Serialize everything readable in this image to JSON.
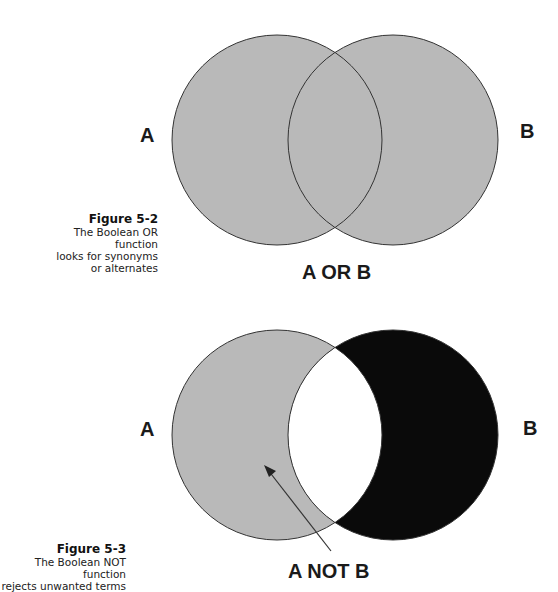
{
  "figures": [
    {
      "id_label": "Figure 5-2",
      "caption_lines": [
        "The Boolean OR function",
        "looks for synonyms",
        "or alternates"
      ],
      "set_a_label": "A",
      "set_b_label": "B",
      "operation_label": "A OR B",
      "shading": {
        "a_only": "#b9b9b9",
        "intersection": "#b9b9b9",
        "b_only": "#b9b9b9"
      }
    },
    {
      "id_label": "Figure 5-3",
      "caption_lines": [
        "The Boolean NOT function",
        "rejects unwanted terms"
      ],
      "set_a_label": "A",
      "set_b_label": "B",
      "operation_label": "A NOT B",
      "shading": {
        "a_only": "#b9b9b9",
        "intersection": "#ffffff",
        "b_only": "#0a0a0a"
      }
    }
  ],
  "colors": {
    "stroke": "#333333",
    "gray_fill": "#b9b9b9",
    "black_fill": "#0a0a0a",
    "background": "#ffffff"
  }
}
